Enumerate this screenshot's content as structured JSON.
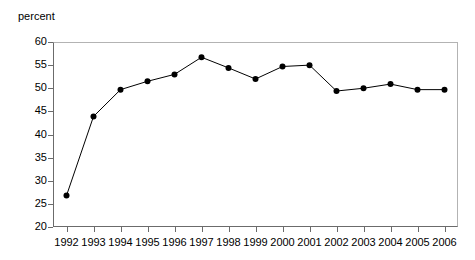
{
  "chart_data": {
    "type": "line",
    "title": "",
    "ylabel": "percent",
    "xlabel": "",
    "ylim": [
      20,
      60
    ],
    "ytick_step": 5,
    "yticks": [
      20,
      25,
      30,
      35,
      40,
      45,
      50,
      55,
      60
    ],
    "grid": false,
    "legend": null,
    "marker": "filled-circle",
    "line_color": "#000000",
    "marker_color": "#000000",
    "frame_color": "#b3b3b3",
    "axis_color": "#6b6b6b",
    "categories": [
      "1992",
      "1993",
      "1994",
      "1995",
      "1996",
      "1997",
      "1998",
      "1999",
      "2000",
      "2001",
      "2002",
      "2003",
      "2004",
      "2005",
      "2006"
    ],
    "values": [
      26.8,
      43.9,
      49.7,
      51.5,
      53.0,
      56.7,
      54.4,
      52.0,
      54.7,
      55.0,
      49.4,
      50.0,
      50.9,
      49.7,
      49.7
    ]
  }
}
